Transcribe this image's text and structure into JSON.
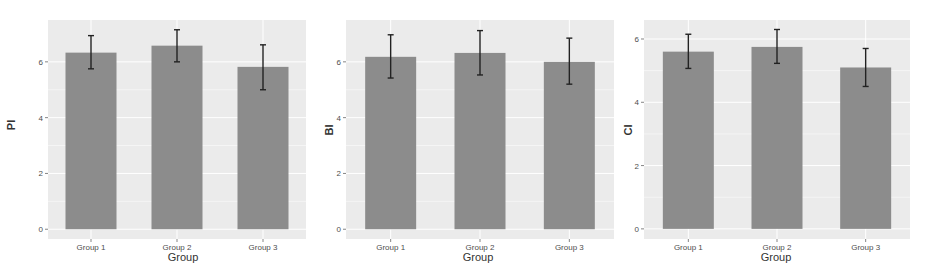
{
  "colors": {
    "panel_background": "#ebebeb",
    "gridline": "#ffffff",
    "bar_fill": "#8c8c8c",
    "errorbar": "#222222",
    "tick_text": "#4d4d4d",
    "axis_title": "#333333"
  },
  "chart_data": [
    {
      "type": "bar",
      "title": "",
      "xlabel": "Group",
      "ylabel": "PI",
      "categories": [
        "Group 1",
        "Group 2",
        "Group 3"
      ],
      "values": [
        6.33,
        6.58,
        5.82
      ],
      "error_bars": [
        {
          "lower": 5.75,
          "upper": 6.94
        },
        {
          "lower": 6.0,
          "upper": 7.15
        },
        {
          "lower": 5.0,
          "upper": 6.61
        }
      ],
      "yticks": [
        0,
        2,
        4,
        6
      ],
      "ylim": [
        -0.35,
        7.5
      ],
      "grid": true,
      "legend": null
    },
    {
      "type": "bar",
      "title": "",
      "xlabel": "Group",
      "ylabel": "BI",
      "categories": [
        "Group 1",
        "Group 2",
        "Group 3"
      ],
      "values": [
        6.18,
        6.32,
        6.0
      ],
      "error_bars": [
        {
          "lower": 5.42,
          "upper": 6.97
        },
        {
          "lower": 5.53,
          "upper": 7.12
        },
        {
          "lower": 5.2,
          "upper": 6.85
        }
      ],
      "yticks": [
        0,
        2,
        4,
        6
      ],
      "ylim": [
        -0.35,
        7.5
      ],
      "grid": true,
      "legend": null
    },
    {
      "type": "bar",
      "title": "",
      "xlabel": "Group",
      "ylabel": "CI",
      "categories": [
        "Group 1",
        "Group 2",
        "Group 3"
      ],
      "values": [
        5.6,
        5.75,
        5.1
      ],
      "error_bars": [
        {
          "lower": 5.07,
          "upper": 6.15
        },
        {
          "lower": 5.23,
          "upper": 6.3
        },
        {
          "lower": 4.5,
          "upper": 5.7
        }
      ],
      "yticks": [
        0,
        2,
        4,
        6
      ],
      "ylim": [
        -0.32,
        6.6
      ],
      "grid": true,
      "legend": null
    }
  ]
}
